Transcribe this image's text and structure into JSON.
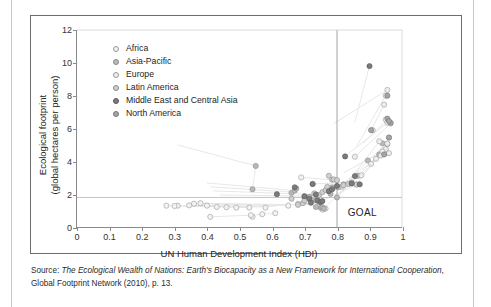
{
  "figure": {
    "goal_label": "GOAL"
  },
  "caption": {
    "prefix": "Source: ",
    "title_italic": "The Ecological Wealth of Nations: Earth's Biocapacity as a New Framework for International Cooperation",
    "suffix": ", Global Footprint Network (2010), p. 13."
  },
  "chart_data": {
    "type": "scatter",
    "title": "",
    "xlabel": "UN Human Development Index (HDI)",
    "ylabel": "Ecological footprint (global hectares per person)",
    "ylabel_line1": "Ecological footprint",
    "ylabel_line2": "(global hectares per person)",
    "xlim": [
      0,
      1
    ],
    "ylim": [
      0,
      12
    ],
    "xticks": [
      0,
      0.1,
      0.2,
      0.3,
      0.4,
      0.5,
      0.6,
      0.7,
      0.8,
      0.9,
      1
    ],
    "xticklabels": [
      "0",
      "0.1",
      "0.2",
      "0.3",
      "0.4",
      "0.5",
      "0.6",
      "0.7",
      "0.8",
      "0.9",
      "1"
    ],
    "yticks": [
      0,
      2,
      4,
      6,
      8,
      10,
      12
    ],
    "yticklabels": [
      "0",
      "2",
      "4",
      "6",
      "8",
      "10",
      "12"
    ],
    "grid": false,
    "legend_position": "top-left",
    "reference_lines": [
      {
        "name": "world-biocapacity-line",
        "orientation": "horizontal",
        "value": 1.8,
        "color": "#b5b5b5"
      },
      {
        "name": "hdi-threshold-line",
        "orientation": "vertical",
        "value": 0.8,
        "color": "#8f8f8f"
      }
    ],
    "annotations": [
      {
        "name": "goal-quadrant-label",
        "text": "GOAL",
        "x": 0.875,
        "y": 1.0
      }
    ],
    "series": [
      {
        "name": "Africa",
        "color": "#f2f2f2",
        "edge": "#9a9a9a",
        "points": [
          [
            0.41,
            0.62
          ],
          [
            0.43,
            1.22
          ],
          [
            0.46,
            1.2
          ],
          [
            0.49,
            1.18
          ],
          [
            0.53,
            1.18
          ],
          [
            0.54,
            0.62
          ],
          [
            0.535,
            0.72
          ],
          [
            0.57,
            0.78
          ],
          [
            0.61,
            0.84
          ],
          [
            0.58,
            1.18
          ],
          [
            0.65,
            1.3
          ],
          [
            0.68,
            1.42
          ],
          [
            0.71,
            1.55
          ],
          [
            0.36,
            1.42
          ],
          [
            0.38,
            1.45
          ],
          [
            0.4,
            1.3
          ],
          [
            0.275,
            1.3
          ],
          [
            0.31,
            1.3
          ],
          [
            0.345,
            1.32
          ],
          [
            0.3,
            1.28
          ],
          [
            0.69,
            3.02
          ],
          [
            0.755,
            1.06
          ],
          [
            0.765,
            1.12
          ]
        ]
      },
      {
        "name": "Asia-Pacific",
        "color": "#b9b9b9",
        "edge": "#8a8a8a",
        "points": [
          [
            0.54,
            2.3
          ],
          [
            0.55,
            3.72
          ],
          [
            0.66,
            2.08
          ],
          [
            0.67,
            2.22
          ],
          [
            0.675,
            2.35
          ],
          [
            0.7,
            1.78
          ],
          [
            0.715,
            1.85
          ],
          [
            0.725,
            2.62
          ],
          [
            0.735,
            1.62
          ],
          [
            0.745,
            1.52
          ],
          [
            0.75,
            1.18
          ],
          [
            0.755,
            1.2
          ],
          [
            0.76,
            1.12
          ],
          [
            0.735,
            1.22
          ],
          [
            0.775,
            2.18
          ],
          [
            0.78,
            2.02
          ],
          [
            0.785,
            2.42
          ],
          [
            0.8,
            1.8
          ],
          [
            0.82,
            2.6
          ],
          [
            0.845,
            2.72
          ],
          [
            0.865,
            3.12
          ],
          [
            0.895,
            4.05
          ],
          [
            0.93,
            4.42
          ],
          [
            0.945,
            4.48
          ],
          [
            0.95,
            4.55
          ],
          [
            0.955,
            5.05
          ],
          [
            0.94,
            5.1
          ]
        ]
      },
      {
        "name": "Europe",
        "color": "#ededed",
        "edge": "#9a9a9a",
        "points": [
          [
            0.8,
            2.42
          ],
          [
            0.815,
            2.45
          ],
          [
            0.86,
            2.6
          ],
          [
            0.875,
            3.15
          ],
          [
            0.905,
            3.85
          ],
          [
            0.92,
            4.15
          ],
          [
            0.935,
            4.35
          ],
          [
            0.945,
            4.55
          ],
          [
            0.95,
            4.75
          ],
          [
            0.955,
            5.08
          ],
          [
            0.96,
            5.45
          ],
          [
            0.955,
            6.35
          ],
          [
            0.95,
            6.55
          ],
          [
            0.945,
            7.45
          ],
          [
            0.95,
            8.0
          ],
          [
            0.955,
            8.35
          ],
          [
            0.91,
            5.9
          ],
          [
            0.855,
            4.28
          ],
          [
            0.93,
            5.22
          ],
          [
            0.965,
            6.3
          ],
          [
            0.94,
            4.6
          ],
          [
            0.96,
            4.5
          ]
        ]
      },
      {
        "name": "Latin America",
        "color": "#cfcfcf",
        "edge": "#8a8a8a",
        "points": [
          [
            0.695,
            1.45
          ],
          [
            0.7,
            1.62
          ],
          [
            0.72,
            1.65
          ],
          [
            0.73,
            2.05
          ],
          [
            0.745,
            1.95
          ],
          [
            0.755,
            2.12
          ],
          [
            0.765,
            2.25
          ],
          [
            0.77,
            2.45
          ],
          [
            0.775,
            3.12
          ],
          [
            0.785,
            2.88
          ],
          [
            0.79,
            2.9
          ],
          [
            0.8,
            2.85
          ],
          [
            0.805,
            2.42
          ],
          [
            0.82,
            2.55
          ],
          [
            0.835,
            2.62
          ],
          [
            0.86,
            2.58
          ],
          [
            0.66,
            1.72
          ],
          [
            0.68,
            1.35
          ]
        ]
      },
      {
        "name": "Middle East and Central Asia",
        "color": "#7b7b7b",
        "edge": "#5a5a5a",
        "points": [
          [
            0.67,
            2.42
          ],
          [
            0.7,
            1.88
          ],
          [
            0.715,
            1.72
          ],
          [
            0.725,
            2.62
          ],
          [
            0.735,
            1.98
          ],
          [
            0.74,
            1.62
          ],
          [
            0.75,
            1.52
          ],
          [
            0.755,
            1.58
          ],
          [
            0.775,
            2.18
          ],
          [
            0.785,
            2.3
          ],
          [
            0.8,
            2.5
          ],
          [
            0.825,
            4.3
          ],
          [
            0.845,
            2.65
          ],
          [
            0.855,
            3.1
          ],
          [
            0.9,
            9.8
          ],
          [
            0.87,
            2.6
          ],
          [
            0.615,
            2.0
          ],
          [
            0.72,
            1.48
          ]
        ]
      },
      {
        "name": "North America",
        "color": "#a5a5a5",
        "edge": "#777777",
        "points": [
          [
            0.905,
            5.9
          ],
          [
            0.955,
            6.6
          ],
          [
            0.965,
            6.35
          ],
          [
            0.96,
            6.45
          ],
          [
            0.955,
            8.0
          ],
          [
            0.945,
            4.42
          ],
          [
            0.96,
            5.45
          ]
        ]
      }
    ],
    "trajectory_lines": {
      "description": "faint grey polylines connecting each country's historical path",
      "color": "#dcdcdc",
      "paths": [
        [
          [
            0.31,
            5.0
          ],
          [
            0.55,
            3.72
          ]
        ],
        [
          [
            0.55,
            3.72
          ],
          [
            0.54,
            2.3
          ]
        ],
        [
          [
            0.4,
            2.68
          ],
          [
            0.67,
            2.22
          ]
        ],
        [
          [
            0.41,
            2.45
          ],
          [
            0.68,
            2.1
          ]
        ],
        [
          [
            0.42,
            2.2
          ],
          [
            0.7,
            2.0
          ]
        ],
        [
          [
            0.44,
            1.95
          ],
          [
            0.72,
            1.88
          ]
        ],
        [
          [
            0.275,
            1.3
          ],
          [
            0.53,
            1.18
          ]
        ],
        [
          [
            0.3,
            1.28
          ],
          [
            0.57,
            1.22
          ]
        ],
        [
          [
            0.345,
            1.32
          ],
          [
            0.61,
            1.26
          ]
        ],
        [
          [
            0.36,
            1.42
          ],
          [
            0.65,
            1.3
          ]
        ],
        [
          [
            0.38,
            1.45
          ],
          [
            0.68,
            1.35
          ]
        ],
        [
          [
            0.41,
            0.62
          ],
          [
            0.535,
            0.72
          ]
        ],
        [
          [
            0.535,
            0.72
          ],
          [
            0.61,
            0.84
          ]
        ],
        [
          [
            0.69,
            3.02
          ],
          [
            0.8,
            2.85
          ]
        ],
        [
          [
            0.72,
            2.62
          ],
          [
            0.845,
            2.72
          ]
        ],
        [
          [
            0.745,
            1.52
          ],
          [
            0.86,
            2.58
          ]
        ],
        [
          [
            0.755,
            1.06
          ],
          [
            0.865,
            3.12
          ]
        ],
        [
          [
            0.8,
            1.8
          ],
          [
            0.93,
            4.42
          ]
        ],
        [
          [
            0.805,
            2.42
          ],
          [
            0.945,
            4.55
          ]
        ],
        [
          [
            0.82,
            2.6
          ],
          [
            0.95,
            5.05
          ]
        ],
        [
          [
            0.825,
            4.3
          ],
          [
            0.955,
            6.35
          ]
        ],
        [
          [
            0.855,
            4.28
          ],
          [
            0.965,
            6.3
          ]
        ],
        [
          [
            0.86,
            2.6
          ],
          [
            0.955,
            5.08
          ]
        ],
        [
          [
            0.875,
            3.15
          ],
          [
            0.95,
            4.75
          ]
        ],
        [
          [
            0.79,
            6.3
          ],
          [
            0.955,
            8.35
          ]
        ],
        [
          [
            0.86,
            4.9
          ],
          [
            0.95,
            8.0
          ]
        ],
        [
          [
            0.9,
            9.8
          ],
          [
            0.855,
            6.4
          ]
        ],
        [
          [
            0.88,
            5.1
          ],
          [
            0.955,
            6.55
          ]
        ],
        [
          [
            0.905,
            3.85
          ],
          [
            0.96,
            5.45
          ]
        ],
        [
          [
            0.92,
            4.15
          ],
          [
            0.955,
            4.5
          ]
        ],
        [
          [
            0.905,
            5.9
          ],
          [
            0.945,
            7.45
          ]
        ],
        [
          [
            0.82,
            3.3
          ],
          [
            0.94,
            4.6
          ]
        ],
        [
          [
            0.84,
            2.9
          ],
          [
            0.93,
            5.22
          ]
        ]
      ]
    }
  },
  "legend": {
    "items": [
      {
        "label": "Africa",
        "color": "#f2f2f2",
        "edge": "#9a9a9a"
      },
      {
        "label": "Asia-Pacific",
        "color": "#b9b9b9",
        "edge": "#8a8a8a"
      },
      {
        "label": "Europe",
        "color": "#ededed",
        "edge": "#9a9a9a"
      },
      {
        "label": "Latin America",
        "color": "#cfcfcf",
        "edge": "#8a8a8a"
      },
      {
        "label": "Middle East and Central Asia",
        "color": "#7b7b7b",
        "edge": "#5a5a5a"
      },
      {
        "label": "North America",
        "color": "#a5a5a5",
        "edge": "#777777"
      }
    ]
  }
}
